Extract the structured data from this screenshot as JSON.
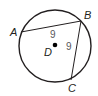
{
  "diagram": {
    "type": "circle-geometry",
    "circle": {
      "cx": 55,
      "cy": 46,
      "r": 36,
      "stroke": "#231f20"
    },
    "center": {
      "label": "D",
      "x": 55,
      "y": 45
    },
    "points": [
      {
        "label": "A",
        "x": 20,
        "y": 32
      },
      {
        "label": "B",
        "x": 81,
        "y": 21
      },
      {
        "label": "C",
        "x": 71,
        "y": 80
      }
    ],
    "chords": [
      {
        "from": "A",
        "to": "B",
        "length_label": "9"
      },
      {
        "from": "B",
        "to": "C",
        "length_label": "9"
      }
    ],
    "labels": {
      "A": "A",
      "B": "B",
      "C": "C",
      "D": "D",
      "AB": "9",
      "BC": "9"
    }
  }
}
